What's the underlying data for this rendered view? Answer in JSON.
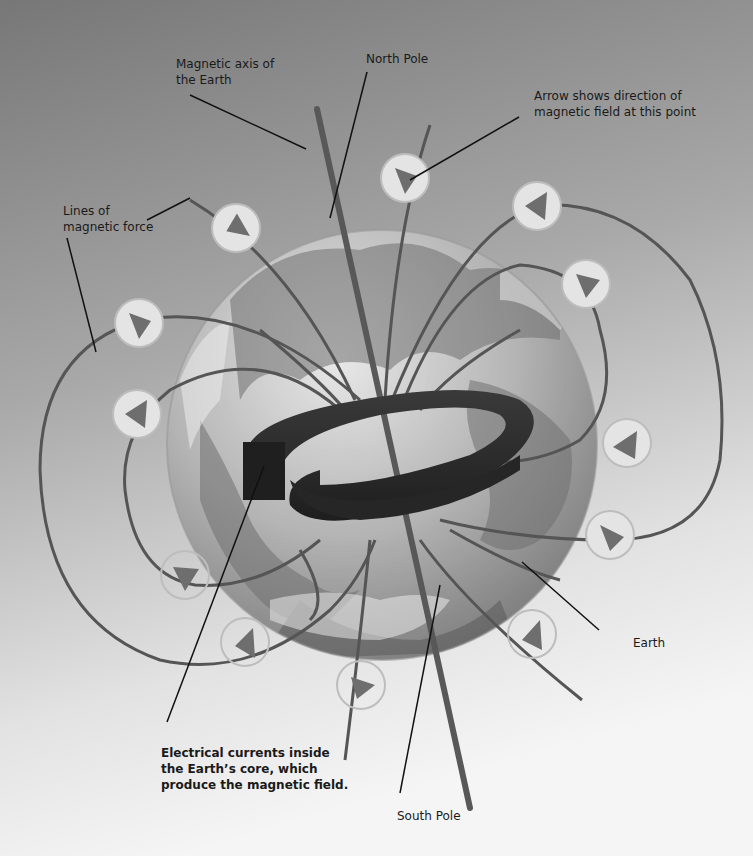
{
  "colors": {
    "bg_top": "#7a7a7a",
    "bg_bottom": "#f4f4f4",
    "field_line": "#5a5a5a",
    "axis_bar": "#585858",
    "arrow_circle_fill": "#e6e6e6",
    "arrow_circle_stroke": "#b8b8b8",
    "arrow_head": "#6e6e6e",
    "coil": "#2a2a2a",
    "globe_light": "#d8d8d8",
    "globe_dark": "#8a8a8a",
    "leader_line": "#111111"
  },
  "labels": {
    "magnetic_axis": "Magnetic axis of\nthe Earth",
    "north_pole": "North Pole",
    "arrow_direction": "Arrow shows direction of\nmagnetic field at this point",
    "lines_of_force": "Lines of\nmagnetic force",
    "earth": "Earth",
    "electrical_currents": "Electrical currents inside\nthe Earth’s core, which\nproduce the magnetic field.",
    "south_pole": "South Pole"
  }
}
